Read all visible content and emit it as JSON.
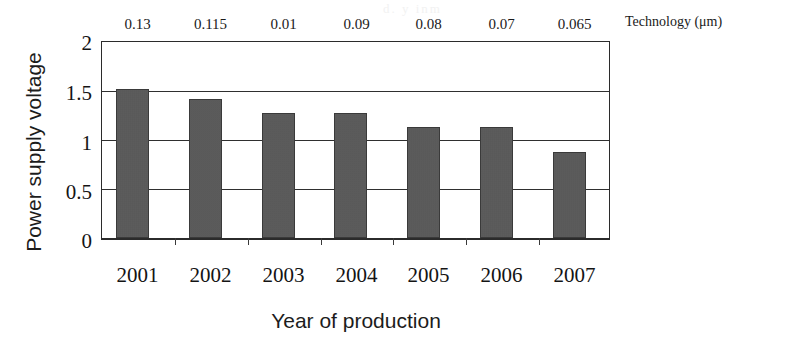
{
  "chart_data": {
    "type": "bar",
    "title": "",
    "categories": [
      "2001",
      "2002",
      "2003",
      "2004",
      "2005",
      "2006",
      "2007"
    ],
    "values": [
      1.52,
      1.42,
      1.28,
      1.28,
      1.13,
      1.13,
      0.88
    ],
    "series": [
      {
        "name": "Power supply voltage",
        "values": [
          1.52,
          1.42,
          1.28,
          1.28,
          1.13,
          1.13,
          0.88
        ]
      }
    ],
    "xlabel": "Year of production",
    "ylabel": "Power supply voltage",
    "ylim": [
      0,
      2
    ],
    "yticks": [
      "0",
      "0.5",
      "1",
      "1.5",
      "2"
    ],
    "ytick_values": [
      0,
      0.5,
      1,
      1.5,
      2
    ],
    "grid": "horizontal",
    "legend": "none",
    "secondary_axis": {
      "label": "Technology (μm)",
      "position": "top",
      "tick_labels": [
        "0.13",
        "0.115",
        "0.01",
        "0.09",
        "0.08",
        "0.07",
        "0.065"
      ],
      "tick_values": [
        0.13,
        0.115,
        0.01,
        0.09,
        0.08,
        0.07,
        0.065
      ]
    },
    "colors": {
      "bar_fill": "#585858",
      "bar_edge": "#3a3a3a",
      "axis": "#2b2b2b",
      "grid": "#2f2f2f",
      "text": "#141414",
      "background": "#ffffff"
    }
  },
  "artifact": {
    "text": "d.  y inm"
  }
}
